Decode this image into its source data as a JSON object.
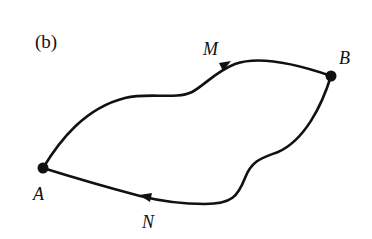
{
  "figure": {
    "panel_label": "(b)",
    "points": [
      {
        "name": "A",
        "x": 43,
        "y": 168
      },
      {
        "name": "B",
        "x": 331,
        "y": 76
      }
    ],
    "paths": [
      {
        "name": "M",
        "from": "A",
        "to": "B",
        "direction": "A to B"
      },
      {
        "name": "N",
        "from": "B",
        "to": "A",
        "direction": "B to A"
      }
    ],
    "labels": {
      "A": "A",
      "B": "B",
      "M": "M",
      "N": "N"
    },
    "colors": {
      "stroke": "#111111",
      "background": "#ffffff"
    }
  }
}
